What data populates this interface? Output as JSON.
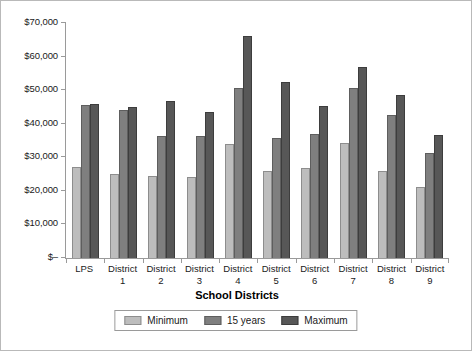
{
  "chart_data": {
    "type": "bar",
    "title": "",
    "xlabel": "School Districts",
    "ylabel": "",
    "ylim": [
      0,
      70000
    ],
    "ytick_step": 10000,
    "ytick_labels": [
      "$–",
      "$10,000",
      "$20,000",
      "$30,000",
      "$40,000",
      "$50,000",
      "$60,000",
      "$70,000"
    ],
    "grid": false,
    "legend_position": "bottom",
    "categories": [
      "LPS",
      "District 1",
      "District 2",
      "District 3",
      "District 4",
      "District 5",
      "District 6",
      "District 7",
      "District 8",
      "District 9"
    ],
    "category_lines": [
      [
        "LPS",
        ""
      ],
      [
        "District",
        "1"
      ],
      [
        "District",
        "2"
      ],
      [
        "District",
        "3"
      ],
      [
        "District",
        "4"
      ],
      [
        "District",
        "5"
      ],
      [
        "District",
        "6"
      ],
      [
        "District",
        "7"
      ],
      [
        "District",
        "8"
      ],
      [
        "District",
        "9"
      ]
    ],
    "series": [
      {
        "name": "Minimum",
        "color": "#bdbdbd",
        "values": [
          27200,
          25000,
          24400,
          24000,
          33900,
          25800,
          26900,
          34400,
          25900,
          21100
        ]
      },
      {
        "name": "15 years",
        "color": "#7f7f7f",
        "values": [
          45500,
          44200,
          36200,
          36200,
          50600,
          35700,
          36900,
          50500,
          42600,
          31400
        ]
      },
      {
        "name": "Maximum",
        "color": "#575757",
        "values": [
          46000,
          45000,
          46800,
          43600,
          66000,
          52300,
          45400,
          56900,
          48700,
          36600
        ]
      }
    ]
  },
  "legend": {
    "items": [
      {
        "label": "Minimum",
        "swatch": "legend-swatch-minimum"
      },
      {
        "label": "15 years",
        "swatch": "legend-swatch-15-years"
      },
      {
        "label": "Maximum",
        "swatch": "legend-swatch-maximum"
      }
    ]
  },
  "axis": {
    "x_title": "School Districts"
  }
}
